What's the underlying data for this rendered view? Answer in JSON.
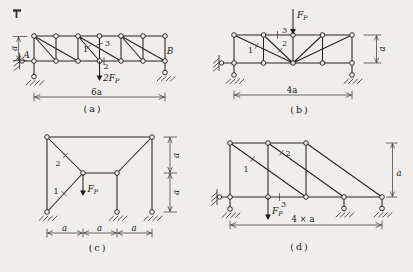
{
  "colors": {
    "paper": "#efeeea",
    "ink": "#26241f"
  },
  "panel_a": {
    "caption": "(a)",
    "support_left_label": "A",
    "support_right_label": "B",
    "member_labels": {
      "m1": "1",
      "m2": "2",
      "m3": "3"
    },
    "load": {
      "coef": "2F",
      "sub": "P"
    },
    "dim_height": "a",
    "dim_span": "6a"
  },
  "panel_b": {
    "caption": "(b)",
    "member_labels": {
      "m1": "1",
      "m2": "2",
      "m3": "3"
    },
    "load": {
      "coef": "F",
      "sub": "P"
    },
    "dim_height": "a",
    "dim_span": "4a"
  },
  "panel_c": {
    "caption": "(c)",
    "member_labels": {
      "m1": "1",
      "m2": "2"
    },
    "load": {
      "coef": "F",
      "sub": "P"
    },
    "dim_heights": [
      "a",
      "a"
    ],
    "dim_spans": [
      "a",
      "a",
      "a"
    ]
  },
  "panel_d": {
    "caption": "(d)",
    "member_labels": {
      "m1": "1",
      "m2": "2",
      "m3": "3"
    },
    "load": {
      "coef": "F",
      "sub": "P"
    },
    "dim_height": "a",
    "dim_span": "4 × a"
  }
}
